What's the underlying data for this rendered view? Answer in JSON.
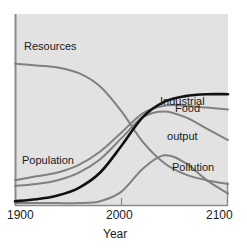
{
  "chart_data": {
    "type": "line",
    "title": "",
    "subtitle": "",
    "xlabel": "Year",
    "ylabel": "",
    "xlim": [
      1900,
      2100
    ],
    "ylim": [
      0,
      1
    ],
    "grid": false,
    "legend_position": "inline-annotations",
    "xticks": [
      1900,
      2000,
      2100
    ],
    "xtick_labels": [
      "1900",
      "2000",
      "2100"
    ],
    "yticks": [],
    "ytick_labels": [],
    "annotations": [
      {
        "text": "Resources",
        "series": "Resources",
        "x": 1910,
        "y": 0.8
      },
      {
        "text": "Population",
        "series": "Population",
        "x": 1908,
        "y": 0.26
      },
      {
        "text": "Industrial\noutput",
        "series": "Industrial output",
        "x": 2046,
        "y": 0.68
      },
      {
        "text": "Food",
        "series": "Food",
        "x": 2060,
        "y": 0.53
      },
      {
        "text": "Pollution",
        "series": "Pollution",
        "x": 2058,
        "y": 0.23
      }
    ],
    "x": [
      1900,
      1920,
      1940,
      1960,
      1980,
      2000,
      2020,
      2040,
      2060,
      2080,
      2100
    ],
    "series": [
      {
        "name": "Resources",
        "color": "#808080",
        "width": 2,
        "values": [
          0.74,
          0.73,
          0.72,
          0.69,
          0.62,
          0.49,
          0.33,
          0.22,
          0.16,
          0.13,
          0.11
        ]
      },
      {
        "name": "Population",
        "color": "#111111",
        "width": 2.6,
        "values": [
          0.02,
          0.03,
          0.05,
          0.09,
          0.17,
          0.31,
          0.46,
          0.54,
          0.57,
          0.58,
          0.58
        ]
      },
      {
        "name": "Industrial output",
        "color": "#808080",
        "width": 2,
        "values": [
          0.13,
          0.15,
          0.17,
          0.21,
          0.28,
          0.38,
          0.48,
          0.52,
          0.52,
          0.51,
          0.5
        ]
      },
      {
        "name": "Food",
        "color": "#808080",
        "width": 2,
        "values": [
          0.1,
          0.11,
          0.13,
          0.17,
          0.24,
          0.35,
          0.46,
          0.49,
          0.46,
          0.4,
          0.34
        ]
      },
      {
        "name": "Pollution",
        "color": "#808080",
        "width": 2,
        "values": [
          0.01,
          0.01,
          0.01,
          0.01,
          0.02,
          0.07,
          0.19,
          0.26,
          0.22,
          0.13,
          0.06
        ]
      }
    ]
  },
  "labels": {
    "resources": "Resources",
    "population": "Population",
    "industrial_line1": "Industrial",
    "industrial_line2": "output",
    "food": "Food",
    "pollution": "Pollution",
    "x_tick_start": "1900",
    "x_tick_mid": "2000",
    "x_tick_end": "2100",
    "x_axis_title": "Year"
  },
  "colors": {
    "plot_background": "#e2e2e2",
    "page_background": "#ffffff",
    "axis": "#8a8a8a",
    "gray_curve": "#808080",
    "black_curve": "#111111",
    "text": "#1a1a1a"
  }
}
